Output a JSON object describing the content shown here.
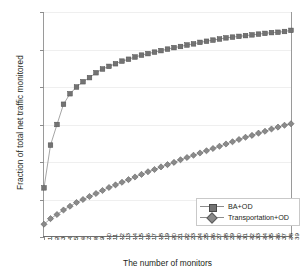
{
  "chart_data": {
    "type": "line",
    "title": "",
    "xlabel": "The number of monitors",
    "ylabel": "Fraction of total net traffic monitored",
    "xlim": [
      1,
      39
    ],
    "ylim": [
      0,
      0.6
    ],
    "grid": "horizontal",
    "legend_position": "inside-lower-right",
    "ytick_labels": [
      "0",
      "0.1",
      "0.2",
      "0.3",
      "0.4",
      "0.5",
      "0.6"
    ],
    "ytick_values": [
      0,
      0.1,
      0.2,
      0.3,
      0.4,
      0.5,
      0.6
    ],
    "categories": [
      1,
      2,
      3,
      4,
      5,
      6,
      7,
      8,
      9,
      10,
      11,
      12,
      13,
      14,
      15,
      16,
      17,
      18,
      19,
      20,
      21,
      22,
      23,
      24,
      25,
      26,
      27,
      28,
      29,
      30,
      31,
      32,
      33,
      34,
      35,
      36,
      37,
      38,
      39
    ],
    "series": [
      {
        "name": "BA+OD",
        "marker": "square",
        "color": "#737373",
        "values": [
          0.131,
          0.245,
          0.3,
          0.354,
          0.382,
          0.4,
          0.414,
          0.425,
          0.438,
          0.448,
          0.455,
          0.462,
          0.469,
          0.474,
          0.48,
          0.485,
          0.489,
          0.493,
          0.497,
          0.501,
          0.505,
          0.508,
          0.512,
          0.515,
          0.519,
          0.522,
          0.525,
          0.528,
          0.531,
          0.533,
          0.535,
          0.537,
          0.539,
          0.541,
          0.543,
          0.545,
          0.546,
          0.548,
          0.551
        ]
      },
      {
        "name": "Transportation+OD",
        "marker": "diamond",
        "color": "#8a8a8a",
        "values": [
          0.034,
          0.049,
          0.06,
          0.072,
          0.082,
          0.092,
          0.1,
          0.108,
          0.116,
          0.124,
          0.132,
          0.139,
          0.146,
          0.153,
          0.16,
          0.167,
          0.174,
          0.18,
          0.187,
          0.193,
          0.199,
          0.206,
          0.212,
          0.218,
          0.224,
          0.23,
          0.236,
          0.242,
          0.248,
          0.254,
          0.26,
          0.266,
          0.271,
          0.277,
          0.282,
          0.288,
          0.293,
          0.298,
          0.302
        ]
      }
    ]
  },
  "legend": {
    "items": [
      {
        "label": "BA+OD"
      },
      {
        "label": "Transportation+OD"
      }
    ]
  }
}
